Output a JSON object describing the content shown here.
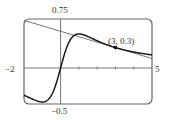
{
  "chart_data": {
    "type": "line",
    "title": "",
    "xlabel": "",
    "ylabel": "",
    "xlim": [
      -2,
      5
    ],
    "ylim": [
      -0.5,
      0.75
    ],
    "grid": false,
    "legend": null,
    "tick_labels": {
      "xmin": "−2",
      "xmax": "5",
      "ymax": "0.75",
      "ymin": "−0.5"
    },
    "series": [
      {
        "name": "curve",
        "function": "x/(x^2+1)",
        "style": "thick",
        "x": [
          -2,
          -1.5,
          -1,
          -0.5,
          0,
          0.5,
          1,
          1.5,
          2,
          3,
          4,
          5
        ],
        "values": [
          -0.4,
          -0.46,
          -0.5,
          -0.4,
          0,
          0.4,
          0.5,
          0.46,
          0.4,
          0.3,
          0.235,
          0.192
        ]
      },
      {
        "name": "tangent line at x=3",
        "style": "thin",
        "x": [
          -2,
          5
        ],
        "values": [
          0.7,
          0.14
        ]
      }
    ],
    "annotations": [
      {
        "text": "(3, 0.3)",
        "x": 3,
        "y": 0.3,
        "marker": "dot"
      }
    ]
  },
  "labels": {
    "ymax": "0.75",
    "ymin": "−0.5",
    "xmin": "−2",
    "xmax": "5",
    "point": "(3, 0.3)"
  }
}
